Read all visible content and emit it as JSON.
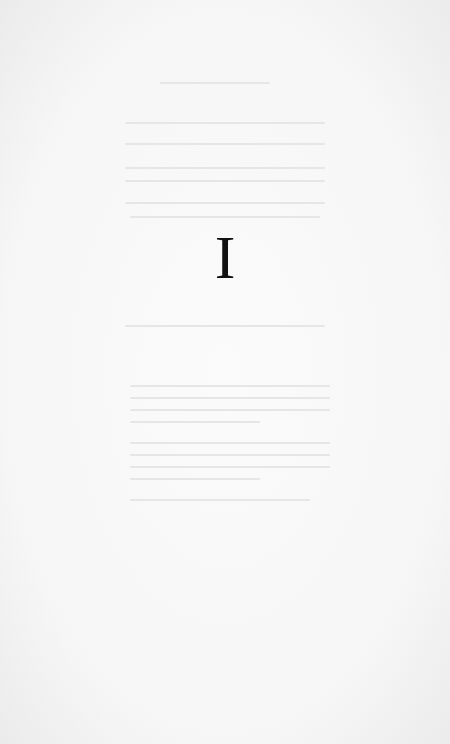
{
  "page": {
    "type": "book-part-divider",
    "numeral": "I",
    "background_color": "#f7f7f7",
    "text_color": "#111111"
  }
}
